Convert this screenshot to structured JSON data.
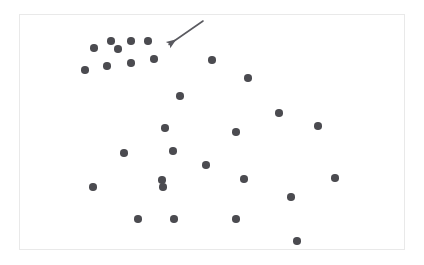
{
  "figure": {
    "type": "scatter-plot",
    "background_color": "#ffffff",
    "frame": {
      "x": 19,
      "y": 14,
      "width": 386,
      "height": 236,
      "border_color": "#e9e9e9"
    }
  },
  "chart_data": {
    "type": "scatter",
    "title": "",
    "subtitle": "",
    "xlabel": "",
    "ylabel": "",
    "xlim": [
      19,
      405
    ],
    "ylim": [
      14,
      250
    ],
    "grid": false,
    "legend": null,
    "axes_visible": false,
    "tick_labels": {
      "x": [],
      "y": []
    },
    "marker": {
      "shape": "circle",
      "color": "#4b4b50",
      "size_px": 7.5,
      "opacity": 1
    },
    "point_count": 29,
    "points": [
      {
        "x": 111,
        "y": 41
      },
      {
        "x": 131,
        "y": 41
      },
      {
        "x": 148,
        "y": 41
      },
      {
        "x": 94,
        "y": 48
      },
      {
        "x": 118,
        "y": 49
      },
      {
        "x": 154,
        "y": 59
      },
      {
        "x": 131,
        "y": 63
      },
      {
        "x": 107,
        "y": 66
      },
      {
        "x": 85,
        "y": 70
      },
      {
        "x": 212,
        "y": 60
      },
      {
        "x": 248,
        "y": 78
      },
      {
        "x": 180,
        "y": 96
      },
      {
        "x": 165,
        "y": 128
      },
      {
        "x": 236,
        "y": 132
      },
      {
        "x": 279,
        "y": 113
      },
      {
        "x": 318,
        "y": 126
      },
      {
        "x": 124,
        "y": 153
      },
      {
        "x": 206,
        "y": 165
      },
      {
        "x": 163,
        "y": 187
      },
      {
        "x": 244,
        "y": 179
      },
      {
        "x": 335,
        "y": 178
      },
      {
        "x": 93,
        "y": 187
      },
      {
        "x": 291,
        "y": 197
      },
      {
        "x": 138,
        "y": 219
      },
      {
        "x": 174,
        "y": 219
      },
      {
        "x": 236,
        "y": 219
      },
      {
        "x": 297,
        "y": 241
      },
      {
        "x": 162,
        "y": 180
      },
      {
        "x": 173,
        "y": 151
      }
    ],
    "annotations": [
      {
        "kind": "arrow",
        "label": "cluster-pointer-arrow",
        "color": "#5a5a60",
        "line_width": 1.6,
        "tail": {
          "x": 203,
          "y": 21
        },
        "head": {
          "x": 164,
          "y": 48
        },
        "description": "arrow pointing toward upper-left dense cluster of points"
      }
    ]
  }
}
